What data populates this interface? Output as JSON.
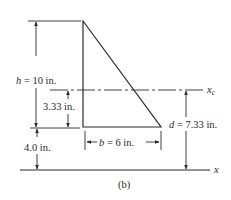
{
  "figure": {
    "caption": "(b)",
    "colors": {
      "ink": "#2a2a2a",
      "background": "#ffffff"
    },
    "shape": "right triangle",
    "dimensions": {
      "height": {
        "symbol": "h",
        "label": "h = 10 in.",
        "value": 10,
        "unit": "in."
      },
      "base": {
        "symbol": "b",
        "label": "b = 6 in.",
        "value": 6,
        "unit": "in."
      },
      "centroid_offset": {
        "label": "3.33 in.",
        "value": 3.33,
        "unit": "in."
      },
      "base_to_axis": {
        "label": "4.0 in.",
        "value": 4.0,
        "unit": "in."
      },
      "d": {
        "symbol": "d",
        "label": "d = 7.33 in.",
        "value": 7.33,
        "unit": "in."
      }
    },
    "axes": {
      "centroidal": {
        "label": "x",
        "subscript": "c"
      },
      "reference": {
        "label": "x"
      }
    }
  }
}
